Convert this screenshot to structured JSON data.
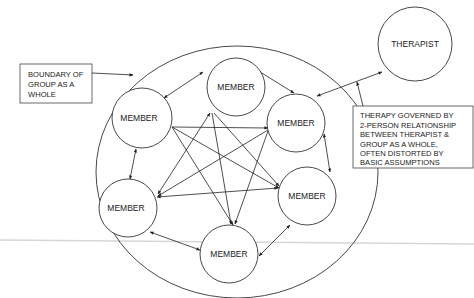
{
  "diagram": {
    "type": "group-dynamics",
    "boundary_label": [
      "BOUNDARY OF",
      "GROUP AS A",
      "WHOLE"
    ],
    "therapy_label": [
      "THERAPY GOVERNED BY",
      "2-PERSON RELATIONSHIP",
      "BETWEEN THERAPIST &",
      "GROUP AS A WHOLE,",
      "OFTEN DISTORTED BY",
      "BASIC ASSUMPTIONS"
    ],
    "therapist": {
      "label": "THERAPIST"
    },
    "members": [
      {
        "id": "top",
        "label": "MEMBER"
      },
      {
        "id": "left-upper",
        "label": "MEMBER"
      },
      {
        "id": "right-upper",
        "label": "MEMBER"
      },
      {
        "id": "left-lower",
        "label": "MEMBER"
      },
      {
        "id": "right-lower",
        "label": "MEMBER"
      },
      {
        "id": "bottom",
        "label": "MEMBER"
      }
    ],
    "colors": {
      "line": "#333333",
      "background": "#ffffff",
      "separator": "#d6d6d6"
    }
  }
}
